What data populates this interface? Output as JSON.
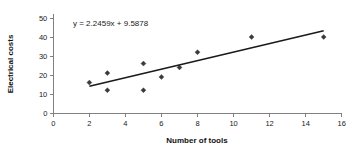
{
  "chart_data": {
    "type": "scatter",
    "title": "",
    "xlabel": "Number of tools",
    "ylabel": "Electrical costs",
    "xlim": [
      0,
      16
    ],
    "ylim": [
      0,
      50
    ],
    "xticks": [
      0,
      2,
      4,
      6,
      8,
      10,
      12,
      14,
      16
    ],
    "yticks": [
      0,
      10,
      20,
      30,
      40,
      50
    ],
    "xtick_labels": [
      "0",
      "2",
      "4",
      "6",
      "8",
      "10",
      "12",
      "14",
      "16"
    ],
    "ytick_labels": [
      "0",
      "10",
      "20",
      "30",
      "40",
      "50"
    ],
    "grid": false,
    "legend": false,
    "annotation": "y = 2.2459x + 9.5878",
    "series": [
      {
        "name": "Electrical costs vs number of tools",
        "marker": "diamond",
        "color": "#3a3a3a",
        "x": [
          2,
          3,
          3,
          5,
          5,
          6,
          7,
          8,
          11,
          15
        ],
        "y": [
          16,
          21,
          12,
          26,
          12,
          19,
          24,
          32,
          40,
          40
        ]
      }
    ],
    "trendline": {
      "type": "linear",
      "slope": 2.2459,
      "intercept": 9.5878,
      "equation": "y = 2.2459x + 9.5878",
      "x_start": 2,
      "x_end": 15,
      "color": "#1a1a1a"
    }
  },
  "axes": {
    "x_title": "Number of tools",
    "y_title": "Electrical costs"
  },
  "colors": {
    "background": "#ffffff",
    "axis": "#808080",
    "marker": "#3a3a3a",
    "trend": "#1a1a1a",
    "text": "#1a1a1a"
  }
}
